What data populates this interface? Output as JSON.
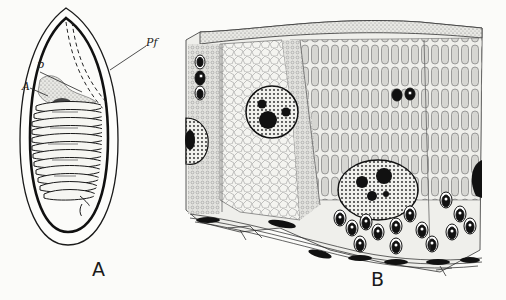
{
  "figure": {
    "panels": [
      {
        "id": "A",
        "label": "A",
        "description": "spore with coiled polar filament",
        "annotations": [
          {
            "key": "p",
            "text": "p"
          },
          {
            "key": "A",
            "text": "A"
          },
          {
            "key": "Pf",
            "text": "Pf"
          }
        ]
      },
      {
        "id": "B",
        "label": "B",
        "description": "histological tissue section"
      }
    ],
    "colors": {
      "ink": "#1a1a1a",
      "paper": "#fbfbf9",
      "stipple": "#8a8a8a"
    }
  }
}
